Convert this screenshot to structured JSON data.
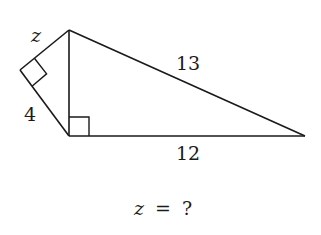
{
  "figure": {
    "type": "geometry-problem",
    "stroke_color": "#1a1a1a",
    "background": "#ffffff",
    "vertices": {
      "top": [
        69,
        30
      ],
      "left": [
        20,
        70
      ],
      "bottom": [
        69,
        136
      ],
      "right": [
        305,
        136
      ]
    },
    "labels": {
      "z": "z",
      "four": "4",
      "thirteen": "13",
      "twelve": "12"
    },
    "question": {
      "var": "z",
      "eq": "=",
      "q": "?"
    },
    "right_angles": [
      "left-vertex",
      "bottom-vertex"
    ]
  }
}
